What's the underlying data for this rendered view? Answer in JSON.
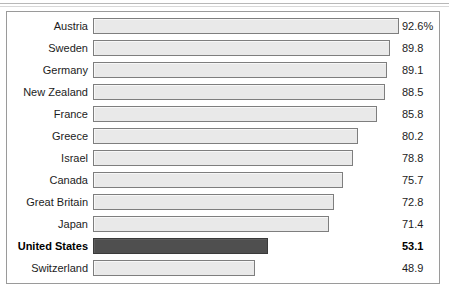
{
  "chart_data": {
    "type": "bar",
    "orientation": "horizontal",
    "title": "",
    "subtitle": "",
    "xlabel": "",
    "ylabel": "",
    "grid": false,
    "legend": false,
    "xlim": [
      0,
      92.6
    ],
    "axis_visible": false,
    "value_suffix_first_row": "%",
    "categories": [
      "Austria",
      "Sweden",
      "Germany",
      "New Zealand",
      "France",
      "Greece",
      "Israel",
      "Canada",
      "Great Britain",
      "Japan",
      "United States",
      "Switzerland"
    ],
    "values": [
      92.6,
      89.8,
      89.1,
      88.5,
      85.8,
      80.2,
      78.8,
      75.7,
      72.8,
      71.4,
      53.1,
      48.9
    ],
    "value_labels": [
      "92.6%",
      "89.8",
      "89.1",
      "88.5",
      "85.8",
      "80.2",
      "78.8",
      "75.7",
      "72.8",
      "71.4",
      "53.1",
      "48.9"
    ],
    "highlight_category": "United States",
    "colors": {
      "bar_fill": "#e9e9e9",
      "bar_border": "#7e7e7e",
      "highlight_fill": "#4f4f4f",
      "highlight_border": "#3a3a3a",
      "frame_border": "#9a9a9a",
      "background": "#ffffff",
      "text": "#1c1c1c"
    },
    "rows": [
      {
        "category": "Austria",
        "value": 92.6,
        "label": "92.6%",
        "highlight": false
      },
      {
        "category": "Sweden",
        "value": 89.8,
        "label": "89.8",
        "highlight": false
      },
      {
        "category": "Germany",
        "value": 89.1,
        "label": "89.1",
        "highlight": false
      },
      {
        "category": "New Zealand",
        "value": 88.5,
        "label": "88.5",
        "highlight": false
      },
      {
        "category": "France",
        "value": 85.8,
        "label": "85.8",
        "highlight": false
      },
      {
        "category": "Greece",
        "value": 80.2,
        "label": "80.2",
        "highlight": false
      },
      {
        "category": "Israel",
        "value": 78.8,
        "label": "78.8",
        "highlight": false
      },
      {
        "category": "Canada",
        "value": 75.7,
        "label": "75.7",
        "highlight": false
      },
      {
        "category": "Great Britain",
        "value": 72.8,
        "label": "72.8",
        "highlight": false
      },
      {
        "category": "Japan",
        "value": 71.4,
        "label": "71.4",
        "highlight": false
      },
      {
        "category": "United States",
        "value": 53.1,
        "label": "53.1",
        "highlight": true
      },
      {
        "category": "Switzerland",
        "value": 48.9,
        "label": "48.9",
        "highlight": false
      }
    ]
  }
}
